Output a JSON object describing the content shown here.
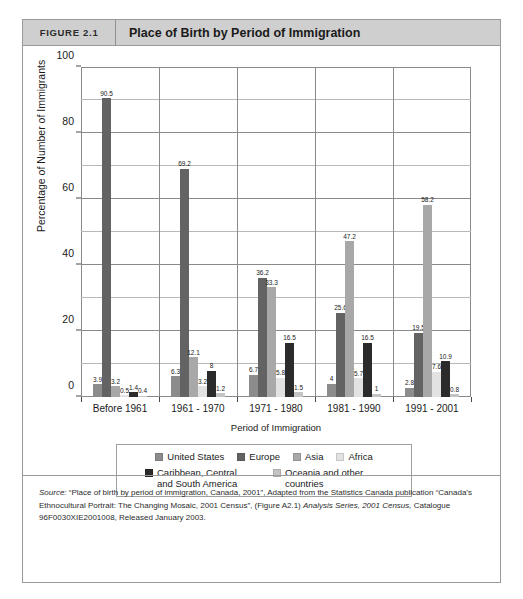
{
  "figure": {
    "number": "FIGURE 2.1",
    "title": "Place of Birth by Period of Immigration"
  },
  "chart_data": {
    "type": "bar",
    "title": "Place of Birth by Period of Immigration",
    "xlabel": "Period of Immigration",
    "ylabel": "Percentage of Number of Immigrants",
    "ylim": [
      0,
      100
    ],
    "yticks": [
      0,
      20,
      40,
      60,
      80,
      100
    ],
    "ytick_labels": [
      "0",
      "20",
      "40",
      "60",
      "80",
      "100"
    ],
    "minor_gridlines": [
      10,
      30,
      50,
      70,
      90
    ],
    "grid": true,
    "legend_position": "bottom",
    "categories": [
      "Before 1961",
      "1961 - 1970",
      "1971 - 1980",
      "1981 - 1990",
      "1991 - 2001"
    ],
    "series": [
      {
        "name": "United States",
        "color": "#8c8c8c",
        "values": [
          3.9,
          6.3,
          6.7,
          4,
          2.8
        ],
        "labels": [
          "3.9",
          "6.3",
          "6.7",
          "4",
          "2.8"
        ]
      },
      {
        "name": "Europe",
        "color": "#636363",
        "values": [
          90.5,
          69.2,
          36.2,
          25.6,
          19.5
        ],
        "labels": [
          "90.5",
          "69.2",
          "36.2",
          "25.6",
          "19.5"
        ]
      },
      {
        "name": "Asia",
        "color": "#a8a8a8",
        "values": [
          3.2,
          12.1,
          33.3,
          47.2,
          58.2
        ],
        "labels": [
          "3.2",
          "12.1",
          "33.3",
          "47.2",
          "58.2"
        ]
      },
      {
        "name": "Africa",
        "color": "#e2e2e2",
        "values": [
          0.5,
          3.2,
          5.8,
          5.7,
          7.6
        ],
        "labels": [
          "0.5",
          "3.2",
          "5.8",
          "5.7",
          "7.6"
        ]
      },
      {
        "name": "Caribbean, Central and South America",
        "color": "#2b2b2b",
        "values": [
          1.4,
          8,
          16.5,
          16.5,
          10.9
        ],
        "labels": [
          "1.4",
          "8",
          "16.5",
          "16.5",
          "10.9"
        ]
      },
      {
        "name": "Oceania and other countries",
        "color": "#c4c4c4",
        "values": [
          0.4,
          1.2,
          1.5,
          1,
          0.8
        ],
        "labels": [
          "0.4",
          "1.2",
          "1.5",
          "1",
          "0.8"
        ]
      }
    ]
  },
  "legend": {
    "row1": [
      {
        "label": "United States",
        "color": "#8c8c8c"
      },
      {
        "label": "Europe",
        "color": "#636363"
      },
      {
        "label": "Asia",
        "color": "#a8a8a8"
      },
      {
        "label": "Africa",
        "color": "#e2e2e2"
      }
    ],
    "row2": [
      {
        "label": "Caribbean, Central and South America",
        "color": "#2b2b2b"
      },
      {
        "label": "Oceania and other countries",
        "color": "#c4c4c4"
      }
    ]
  },
  "source": {
    "lead": "Source:",
    "text": " “Place of birth by period of immigration, Canada, 2001”, Adapted from the Statistics Canada publication “Canada’s Ethnocultural Portrait: The Changing Mosaic, 2001 Census”, (Figure A2.1) ",
    "italic1": "Analysis Series, 2001 Census,",
    "text2": " Catalogue 96F0030XIE2001008, Released January 2003."
  }
}
